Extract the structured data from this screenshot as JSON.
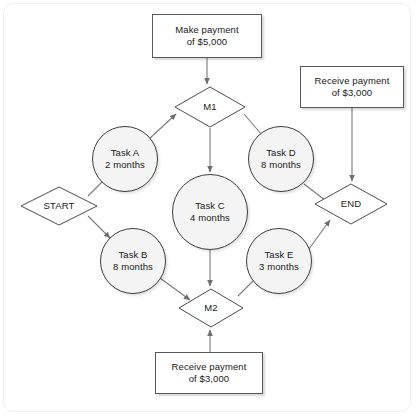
{
  "diagram": {
    "frame": {
      "border_color": "#efefef",
      "background": "#ffffff"
    },
    "colors": {
      "box_fill": "#ffffff",
      "box_stroke": "#595959",
      "circle_fill": "#f4f4f4",
      "circle_stroke": "#3d3d3d",
      "diamond_fill": "#ffffff",
      "diamond_stroke": "#4d4d4d",
      "edge_stroke": "#7a7a7a",
      "text": "#1a1a1a"
    },
    "nodes": [
      {
        "id": "make-payment-5000",
        "shape": "box",
        "label": "Make payment\nof $5,000",
        "x": 152,
        "y": 14,
        "w": 110,
        "h": 44
      },
      {
        "id": "m1",
        "shape": "diamond",
        "label": "M1",
        "x": 174,
        "y": 86,
        "w": 72,
        "h": 42
      },
      {
        "id": "receive-payment-3000-top",
        "shape": "box",
        "label": "Receive payment\nof $3,000",
        "x": 300,
        "y": 66,
        "w": 104,
        "h": 42
      },
      {
        "id": "task-a",
        "shape": "circle",
        "label": "Task A\n2 months",
        "x": 92,
        "y": 126,
        "w": 66,
        "h": 66
      },
      {
        "id": "task-d",
        "shape": "circle",
        "label": "Task D\n8 months",
        "x": 248,
        "y": 126,
        "w": 66,
        "h": 66
      },
      {
        "id": "start",
        "shape": "diamond",
        "label": "START",
        "x": 20,
        "y": 186,
        "w": 78,
        "h": 40
      },
      {
        "id": "task-c",
        "shape": "circle",
        "label": "Task C\n4 months",
        "x": 172,
        "y": 174,
        "w": 76,
        "h": 76
      },
      {
        "id": "end",
        "shape": "diamond",
        "label": "END",
        "x": 314,
        "y": 183,
        "w": 74,
        "h": 42
      },
      {
        "id": "task-b",
        "shape": "circle",
        "label": "Task B\n8 months",
        "x": 100,
        "y": 228,
        "w": 66,
        "h": 66
      },
      {
        "id": "task-e",
        "shape": "circle",
        "label": "Task E\n3 months",
        "x": 246,
        "y": 228,
        "w": 66,
        "h": 66
      },
      {
        "id": "m2",
        "shape": "diamond",
        "label": "M2",
        "x": 178,
        "y": 288,
        "w": 66,
        "h": 40
      },
      {
        "id": "receive-payment-3000-bottom",
        "shape": "box",
        "label": "Receive payment\nof $3,000",
        "x": 155,
        "y": 352,
        "w": 108,
        "h": 42
      }
    ],
    "edges": [
      {
        "from": "make-payment-5000",
        "to": "m1",
        "path": "M 207,58 L 207,84",
        "arrow": true
      },
      {
        "from": "start",
        "to": "task-a",
        "path": "M 88,196 L 108,176",
        "arrow": true
      },
      {
        "from": "start",
        "to": "task-b",
        "path": "M 88,216 L 110,238",
        "arrow": true
      },
      {
        "from": "task-a",
        "to": "m1",
        "path": "M 148,140 L 176,114",
        "arrow": true
      },
      {
        "from": "m1",
        "to": "task-d",
        "path": "M 244,114 L 268,142",
        "arrow": true
      },
      {
        "from": "m1",
        "to": "task-c",
        "path": "M 210,128 L 210,172",
        "arrow": true
      },
      {
        "from": "receive-payment-3000-top",
        "to": "end",
        "path": "M 352,108 L 352,181",
        "arrow": true
      },
      {
        "from": "task-d",
        "to": "end",
        "path": "M 304,184 L 330,204",
        "arrow": true
      },
      {
        "from": "task-e",
        "to": "end",
        "path": "M 306,253 L 330,220",
        "arrow": true
      },
      {
        "from": "task-b",
        "to": "m2",
        "path": "M 160,278 L 190,300",
        "arrow": true
      },
      {
        "from": "task-c",
        "to": "m2",
        "path": "M 210,250 L 210,286",
        "arrow": true
      },
      {
        "from": "m2",
        "to": "task-e",
        "path": "M 238,296 L 262,272",
        "arrow": true
      },
      {
        "from": "receive-payment-3000-bottom",
        "to": "m2",
        "path": "M 210,352 L 210,330",
        "arrow": true
      }
    ]
  }
}
